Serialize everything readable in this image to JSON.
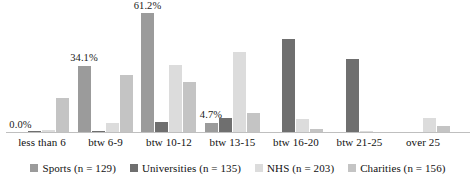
{
  "chart_data": {
    "type": "bar",
    "title": "",
    "subtitle": "",
    "xlabel": "",
    "ylabel": "",
    "grid": false,
    "ylim": [
      0,
      65
    ],
    "legend_position": "bottom",
    "orientation": "vertical",
    "grouping": "grouped",
    "categories": [
      "less than 6",
      "btw 6-9",
      "btw 10-12",
      "btw 13-15",
      "btw 16-20",
      "btw 21-25",
      "over 25"
    ],
    "series": [
      {
        "name": "Sports (n = 129)",
        "short_name": "Sports",
        "n": 129,
        "color": "#9b9b9b",
        "values": [
          0.0,
          34.1,
          61.2,
          4.7,
          0.0,
          0.0,
          0.0
        ],
        "data_labels": [
          "0.0%",
          "34.1%",
          "61.2%",
          "4.7%",
          "",
          "",
          ""
        ]
      },
      {
        "name": "Universities (n = 135)",
        "short_name": "Universities",
        "n": 135,
        "color": "#6f6f6f",
        "values": [
          0.7,
          0.7,
          5.2,
          7.4,
          48.1,
          37.8,
          0.0
        ],
        "data_labels": [
          "",
          "",
          "",
          "",
          "",
          "",
          ""
        ]
      },
      {
        "name": "NHS (n = 203)",
        "short_name": "NHS",
        "n": 203,
        "color": "#dcdcdc",
        "values": [
          1.0,
          4.4,
          34.5,
          41.4,
          6.9,
          0.5,
          7.4
        ],
        "data_labels": [
          "",
          "",
          "",
          "",
          "",
          "",
          ""
        ]
      },
      {
        "name": "Charities (n = 156)",
        "short_name": "Charities",
        "n": 156,
        "color": "#c4c4c4",
        "values": [
          17.3,
          29.5,
          25.6,
          9.6,
          1.3,
          0.0,
          3.2
        ],
        "data_labels": [
          "",
          "",
          "",
          "",
          "",
          "",
          ""
        ]
      }
    ]
  },
  "axis": {
    "baseline_color": "#bfbfbf"
  }
}
